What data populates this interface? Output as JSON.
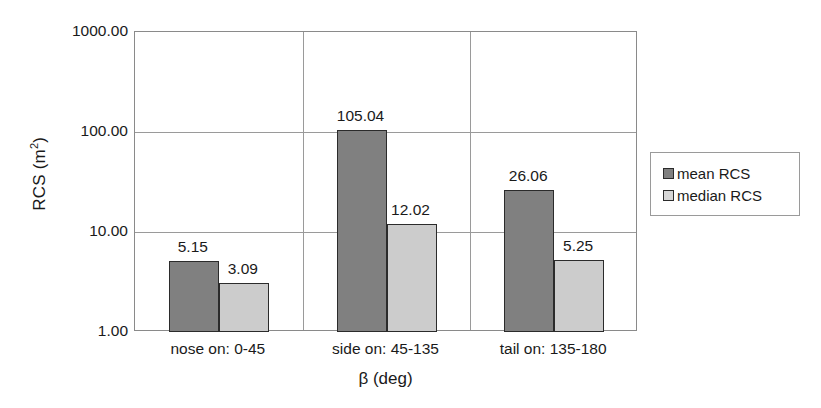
{
  "chart_data": {
    "type": "bar",
    "title": "",
    "xlabel": "β (deg)",
    "ylabel": "RCS (m²)",
    "ylabel_base": "RCS (m",
    "ylabel_sup": "2",
    "ylabel_tail": ")",
    "yscale": "log",
    "ylim": [
      1,
      1000
    ],
    "grid": true,
    "legend_position": "right",
    "categories": [
      "nose on:  0-45",
      "side on: 45-135",
      "tail on: 135-180"
    ],
    "ytick_labels": [
      "1000.00",
      "100.00",
      "10.00",
      "1.00"
    ],
    "ytick_values": [
      1000,
      100,
      10,
      1
    ],
    "series": [
      {
        "name": "mean RCS",
        "color": "#808080",
        "values": [
          5.15,
          105.04,
          26.06
        ],
        "labels": [
          "5.15",
          "105.04",
          "26.06"
        ]
      },
      {
        "name": "median RCS",
        "color": "#cccccc",
        "values": [
          3.09,
          12.02,
          5.25
        ],
        "labels": [
          "3.09",
          "12.02",
          "5.25"
        ]
      }
    ]
  },
  "legend": {
    "items": [
      {
        "label": "mean RCS",
        "swatch": "mean"
      },
      {
        "label": "median RCS",
        "swatch": "median"
      }
    ]
  }
}
